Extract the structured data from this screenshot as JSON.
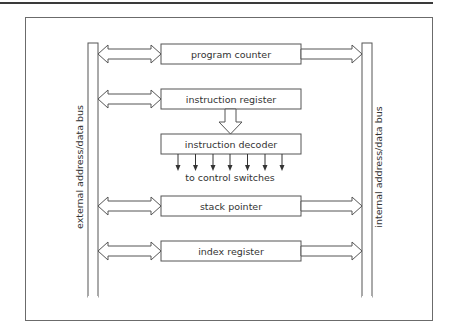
{
  "diagram": {
    "type": "cpu-register-block-diagram",
    "buses": {
      "left": {
        "label": "external address/data bus"
      },
      "right": {
        "label": "internal address/data bus"
      }
    },
    "registers": [
      {
        "id": "program-counter",
        "label": "program counter",
        "left_arrow": "bidirectional",
        "right_arrow": "to-internal-bus"
      },
      {
        "id": "instruction-register",
        "label": "instruction register",
        "left_arrow": "bidirectional",
        "right_arrow": "none"
      },
      {
        "id": "instruction-decoder",
        "label": "instruction decoder",
        "left_arrow": "none",
        "right_arrow": "none"
      },
      {
        "id": "stack-pointer",
        "label": "stack pointer",
        "left_arrow": "bidirectional",
        "right_arrow": "to-internal-bus"
      },
      {
        "id": "index-register",
        "label": "index register",
        "left_arrow": "bidirectional",
        "right_arrow": "to-internal-bus"
      }
    ],
    "decoder_outputs": {
      "count": 7,
      "label": "to control switches"
    },
    "edges": [
      {
        "from": "external-bus",
        "to": "program-counter",
        "kind": "bidirectional"
      },
      {
        "from": "program-counter",
        "to": "internal-bus",
        "kind": "one-way"
      },
      {
        "from": "external-bus",
        "to": "instruction-register",
        "kind": "bidirectional"
      },
      {
        "from": "instruction-register",
        "to": "instruction-decoder",
        "kind": "one-way"
      },
      {
        "from": "instruction-decoder",
        "to": "control-switches",
        "kind": "one-way"
      },
      {
        "from": "external-bus",
        "to": "stack-pointer",
        "kind": "bidirectional"
      },
      {
        "from": "stack-pointer",
        "to": "internal-bus",
        "kind": "one-way"
      },
      {
        "from": "external-bus",
        "to": "index-register",
        "kind": "bidirectional"
      },
      {
        "from": "index-register",
        "to": "internal-bus",
        "kind": "one-way"
      }
    ]
  }
}
